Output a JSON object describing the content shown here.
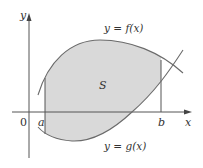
{
  "figure": {
    "colors": {
      "background": "#ffffff",
      "region_fill": "#d9d9d9",
      "curve_stroke": "#6b6b6b",
      "axis_stroke": "#555555",
      "text": "#333333"
    },
    "axes": {
      "x_label": "x",
      "y_label": "y",
      "origin_label": "0"
    },
    "bounds": {
      "left_label": "a",
      "right_label": "b"
    },
    "curves": {
      "upper": {
        "label": "y = f(x)",
        "name": "f"
      },
      "lower": {
        "label": "y = g(x)",
        "name": "g"
      }
    },
    "region": {
      "label": "S"
    }
  }
}
